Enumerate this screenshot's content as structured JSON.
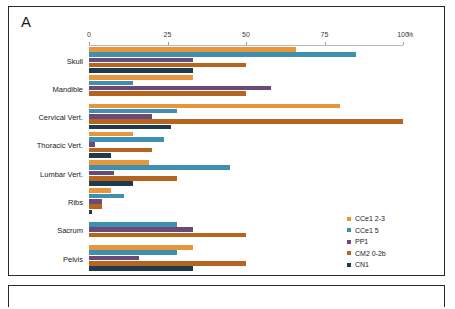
{
  "figure": {
    "panel_label": "A",
    "unit_label": "%"
  },
  "chart_data": {
    "type": "bar",
    "orientation": "horizontal",
    "title": "",
    "xlabel": "%",
    "ylabel": "",
    "xlim": [
      0,
      100
    ],
    "xticks": [
      0,
      25,
      50,
      75,
      100
    ],
    "xtick_labels": [
      "0",
      "25",
      "50",
      "75",
      "100"
    ],
    "grid": false,
    "legend_position": "right-bottom",
    "categories": [
      "Skull",
      "Mandible",
      "Cervical Vert.",
      "Thoracic Vert.",
      "Lumbar Vert.",
      "Ribs",
      "Sacrum",
      "Pelvis"
    ],
    "series": [
      {
        "name": "CCe1 2-3",
        "color": "#E8963C",
        "values": [
          66,
          33,
          80,
          14,
          19,
          7,
          0,
          33
        ]
      },
      {
        "name": "CCe1 5",
        "color": "#3E8FB0",
        "values": [
          85,
          14,
          28,
          24,
          45,
          11,
          28,
          28
        ]
      },
      {
        "name": "PP1",
        "color": "#6B4A7A",
        "values": [
          33,
          58,
          20,
          2,
          8,
          4,
          33,
          16
        ]
      },
      {
        "name": "CM2 0-2b",
        "color": "#B5651D",
        "values": [
          50,
          50,
          100,
          20,
          28,
          4,
          50,
          50
        ]
      },
      {
        "name": "CN1",
        "color": "#1F3A4D",
        "values": [
          33,
          0,
          26,
          7,
          14,
          1,
          0,
          33
        ]
      }
    ]
  }
}
